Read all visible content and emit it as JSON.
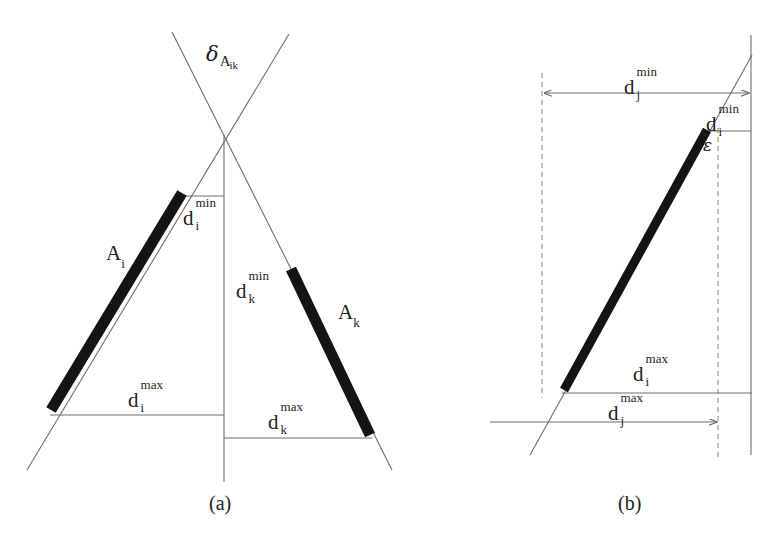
{
  "figure": {
    "background_color": "#ffffff",
    "line_color": "#6e6e6e",
    "dashed_color": "#9a9a9a",
    "bar_color": "#141414",
    "text_color": "#1d1d1d"
  },
  "panel_a": {
    "caption": "(a)",
    "labels": {
      "delta_symbol": "δ",
      "delta_sub_main": "A",
      "delta_sub_indices": "ik",
      "segment_i": "A",
      "segment_i_sub": "i",
      "segment_k": "A",
      "segment_k_sub": "k",
      "d_base": "d",
      "d_i_min_sup": "min",
      "d_i_min_sub": "i",
      "d_k_min_sup": "min",
      "d_k_min_sub": "k",
      "d_i_max_sup": "max",
      "d_i_max_sub": "i",
      "d_k_max_sup": "max",
      "d_k_max_sub": "k"
    }
  },
  "panel_b": {
    "caption": "(b)",
    "labels": {
      "d_base": "d",
      "d_j_min_sup": "min",
      "d_j_min_sub": "j",
      "d_i_min_sup": "min",
      "d_i_min_sub": "i",
      "d_i_max_sup": "max",
      "d_i_max_sub": "i",
      "d_j_max_sup": "max",
      "d_j_max_sub": "j",
      "epsilon": "ε"
    }
  }
}
